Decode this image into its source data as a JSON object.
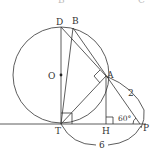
{
  "diagram": {
    "type": "geometry",
    "stroke_color": "#333333",
    "top_cut_labels": [
      "B",
      "C"
    ],
    "points": {
      "O": {
        "label": "O",
        "x": 61,
        "y": 75
      },
      "D": {
        "label": "D",
        "x": 61,
        "y": 27
      },
      "T": {
        "label": "T",
        "x": 61,
        "y": 124
      },
      "B": {
        "label": "B",
        "x": 73,
        "y": 28
      },
      "A": {
        "label": "A",
        "x": 106,
        "y": 76
      },
      "H": {
        "label": "H",
        "x": 106,
        "y": 124
      },
      "P": {
        "label": "P",
        "x": 140,
        "y": 124
      }
    },
    "circle": {
      "center": "O",
      "radius": 48
    },
    "annotations": {
      "AP_length": "2",
      "TP_length": "6",
      "angle_P": "60°"
    },
    "right_angles": [
      "T",
      "H",
      "A"
    ]
  }
}
